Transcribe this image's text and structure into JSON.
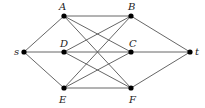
{
  "diagram": {
    "type": "graph",
    "nodes": [
      {
        "id": "s",
        "label": "s",
        "x": 24,
        "y": 52,
        "lx": 14,
        "ly": 55
      },
      {
        "id": "A",
        "label": "A",
        "x": 64,
        "y": 16,
        "lx": 59,
        "ly": 10
      },
      {
        "id": "D",
        "label": "D",
        "x": 64,
        "y": 52,
        "lx": 60,
        "ly": 47
      },
      {
        "id": "E",
        "label": "E",
        "x": 64,
        "y": 88,
        "lx": 59,
        "ly": 103
      },
      {
        "id": "B",
        "label": "B",
        "x": 131,
        "y": 16,
        "lx": 128,
        "ly": 10
      },
      {
        "id": "C",
        "label": "C",
        "x": 131,
        "y": 52,
        "lx": 129,
        "ly": 47
      },
      {
        "id": "F",
        "label": "F",
        "x": 131,
        "y": 88,
        "lx": 129,
        "ly": 103
      },
      {
        "id": "t",
        "label": "t",
        "x": 190,
        "y": 52,
        "lx": 195,
        "ly": 55
      }
    ],
    "edges": [
      [
        "s",
        "A"
      ],
      [
        "s",
        "D"
      ],
      [
        "s",
        "E"
      ],
      [
        "A",
        "B"
      ],
      [
        "A",
        "C"
      ],
      [
        "A",
        "F"
      ],
      [
        "D",
        "B"
      ],
      [
        "D",
        "C"
      ],
      [
        "D",
        "F"
      ],
      [
        "E",
        "B"
      ],
      [
        "E",
        "C"
      ],
      [
        "E",
        "F"
      ],
      [
        "B",
        "t"
      ],
      [
        "C",
        "t"
      ],
      [
        "F",
        "t"
      ]
    ],
    "colors": {
      "edge": "#555555",
      "node": "#000000",
      "label": "#222222"
    }
  }
}
